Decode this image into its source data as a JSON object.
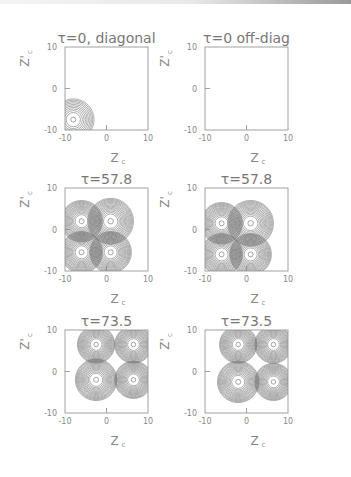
{
  "chart_data": [
    {
      "type": "contour",
      "title": "τ=0, diagonal",
      "xlabel": "Z_c",
      "ylabel": "Z'_c",
      "xlim": [
        -10,
        10
      ],
      "ylim": [
        -10,
        10
      ],
      "xticks": [
        "-10",
        "0",
        "10"
      ],
      "yticks": [
        "-10",
        "0",
        "10"
      ],
      "peaks": [
        {
          "x": -8,
          "y": -7.5,
          "rings": 10,
          "radius": 5
        }
      ]
    },
    {
      "type": "contour",
      "title": "τ=0 off-diag",
      "xlabel": "Z_c",
      "ylabel": "Z'_c",
      "xlim": [
        -10,
        10
      ],
      "ylim": [
        -10,
        10
      ],
      "xticks": [
        "-10",
        "0",
        "10"
      ],
      "yticks": [
        "-10",
        "0",
        "10"
      ],
      "peaks": []
    },
    {
      "type": "contour",
      "title": "τ=57.8",
      "xlabel": "Z_c",
      "ylabel": "Z'_c",
      "xlim": [
        -10,
        10
      ],
      "ylim": [
        -10,
        10
      ],
      "xticks": [
        "-10",
        "0",
        "10"
      ],
      "yticks": [
        "-10",
        "0",
        "10"
      ],
      "peaks": [
        {
          "x": -6,
          "y": 2,
          "rings": 14,
          "radius": 5
        },
        {
          "x": 1,
          "y": 2,
          "rings": 14,
          "radius": 5.5
        },
        {
          "x": -6,
          "y": -5.5,
          "rings": 14,
          "radius": 5
        },
        {
          "x": 1,
          "y": -5.5,
          "rings": 14,
          "radius": 5
        }
      ]
    },
    {
      "type": "contour",
      "title": "τ=57.8",
      "xlabel": "Z_c",
      "ylabel": "Z'_c",
      "xlim": [
        -10,
        10
      ],
      "ylim": [
        -10,
        10
      ],
      "xticks": [
        "-10",
        "0",
        "10"
      ],
      "yticks": [
        "-10",
        "0",
        "10"
      ],
      "peaks": [
        {
          "x": -6,
          "y": 1.5,
          "rings": 14,
          "radius": 5
        },
        {
          "x": 1,
          "y": 1.5,
          "rings": 14,
          "radius": 5.5
        },
        {
          "x": -6,
          "y": -6,
          "rings": 14,
          "radius": 5
        },
        {
          "x": 1,
          "y": -6,
          "rings": 14,
          "radius": 5
        }
      ]
    },
    {
      "type": "contour",
      "title": "τ=73.5",
      "xlabel": "Z_c",
      "ylabel": "Z'_c",
      "xlim": [
        -10,
        10
      ],
      "ylim": [
        -10,
        10
      ],
      "xticks": [
        "-10",
        "0",
        "10"
      ],
      "yticks": [
        "-10",
        "0",
        "10"
      ],
      "peaks": [
        {
          "x": -2.5,
          "y": 6.5,
          "rings": 14,
          "radius": 4.5
        },
        {
          "x": 6.5,
          "y": 6.5,
          "rings": 14,
          "radius": 4.5
        },
        {
          "x": -2.5,
          "y": -2,
          "rings": 14,
          "radius": 5
        },
        {
          "x": 6.5,
          "y": -2,
          "rings": 14,
          "radius": 4.5
        }
      ]
    },
    {
      "type": "contour",
      "title": "τ=73.5",
      "xlabel": "Z_c",
      "ylabel": "Z'_c",
      "xlim": [
        -10,
        10
      ],
      "ylim": [
        -10,
        10
      ],
      "xticks": [
        "-10",
        "0",
        "10"
      ],
      "yticks": [
        "-10",
        "0",
        "10"
      ],
      "peaks": [
        {
          "x": -2,
          "y": 6.5,
          "rings": 14,
          "radius": 4.5
        },
        {
          "x": 6.5,
          "y": 6.5,
          "rings": 14,
          "radius": 4.5
        },
        {
          "x": -2,
          "y": -2.5,
          "rings": 14,
          "radius": 5
        },
        {
          "x": 6.5,
          "y": -2.5,
          "rings": 14,
          "radius": 4.5
        }
      ]
    }
  ],
  "colors": {
    "frame": "#8a8a8a",
    "contour": "#6a6a6a",
    "text": "#888888"
  }
}
